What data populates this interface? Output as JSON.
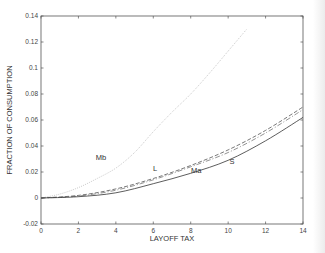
{
  "chart_data": {
    "type": "line",
    "title": "",
    "xlabel": "LAYOFF TAX",
    "ylabel": "FRACTION OF CONSUMPTION",
    "xlim": [
      0,
      14
    ],
    "ylim": [
      -0.02,
      0.14
    ],
    "xticks": [
      0,
      2,
      4,
      6,
      8,
      10,
      12,
      14
    ],
    "yticks": [
      -0.02,
      0,
      0.02,
      0.04,
      0.06,
      0.08,
      0.1,
      0.12,
      0.14
    ],
    "ytick_labels": [
      "-0.02",
      "0",
      "0.02",
      "0.04",
      "0.06",
      "0.08",
      "0.1",
      "0.12",
      "0.14"
    ],
    "grid": false,
    "legend": "none (inline curve labels)",
    "series": [
      {
        "name": "Mb",
        "style": "dotted",
        "color": "#bbbbbb",
        "x": [
          0,
          1,
          2,
          3,
          4,
          5,
          6,
          7,
          8,
          9,
          10,
          11
        ],
        "y": [
          0,
          0.003,
          0.008,
          0.015,
          0.023,
          0.035,
          0.051,
          0.066,
          0.08,
          0.096,
          0.113,
          0.13
        ],
        "label_pos": [
          3.2,
          0.029
        ]
      },
      {
        "name": "L",
        "style": "dashed",
        "color": "#555555",
        "x": [
          0,
          2,
          4,
          6,
          8,
          10,
          12,
          14
        ],
        "y": [
          0,
          0.002,
          0.007,
          0.015,
          0.025,
          0.037,
          0.052,
          0.07
        ],
        "label_pos": [
          6.1,
          0.021
        ]
      },
      {
        "name": "Ma",
        "style": "dashdot",
        "color": "#777777",
        "x": [
          0,
          2,
          4,
          6,
          8,
          10,
          12,
          14
        ],
        "y": [
          0,
          0.0015,
          0.006,
          0.014,
          0.024,
          0.035,
          0.05,
          0.068
        ],
        "label_pos": [
          8.3,
          0.019
        ]
      },
      {
        "name": "S",
        "style": "solid",
        "color": "#333333",
        "x": [
          0,
          2,
          4,
          6,
          8,
          10,
          12,
          14
        ],
        "y": [
          0,
          0.001,
          0.004,
          0.011,
          0.019,
          0.029,
          0.044,
          0.062
        ],
        "label_pos": [
          10.2,
          0.026
        ]
      }
    ]
  }
}
